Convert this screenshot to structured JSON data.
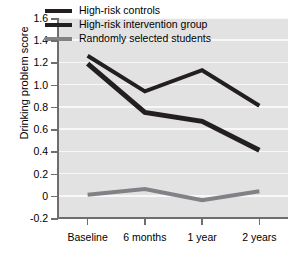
{
  "chart_data": {
    "type": "line",
    "title": "",
    "xlabel": "",
    "ylabel": "Drinking problem score",
    "categories": [
      "Baseline",
      "6 months",
      "1 year",
      "2 years"
    ],
    "ylim": [
      -0.2,
      1.6
    ],
    "yticks": [
      "1.6",
      "1.4",
      "1.2",
      "1.0",
      "0.8",
      "0.6",
      "0.4",
      "0.2",
      "0",
      "-0.2"
    ],
    "ytick_values": [
      1.6,
      1.4,
      1.2,
      1.0,
      0.8,
      0.6,
      0.4,
      0.2,
      0,
      -0.2
    ],
    "grid": true,
    "legend_position": "top-center-inside",
    "series": [
      {
        "name": "High-risk controls",
        "values": [
          1.26,
          0.94,
          1.13,
          0.81
        ],
        "color": "#231f20",
        "width": 4
      },
      {
        "name": "High-risk intervention group",
        "values": [
          1.19,
          0.75,
          0.67,
          0.41
        ],
        "color": "#231f20",
        "width": 5
      },
      {
        "name": "Randomly selected students",
        "values": [
          0.01,
          0.06,
          -0.04,
          0.04
        ],
        "color": "#808285",
        "width": 4
      }
    ]
  },
  "style": {
    "plot_background": "#e2e2e2",
    "gridline_color": "#f8f8f8",
    "axis_color": "#6e6e6e",
    "text_color": "#000000",
    "page_background": "#ffffff"
  }
}
